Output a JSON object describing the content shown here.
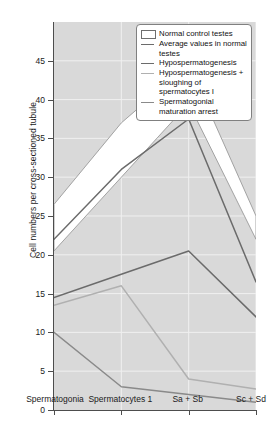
{
  "chart_data": {
    "type": "line",
    "title": "",
    "xlabel": "",
    "ylabel": "Cell numbers per cross-sectioned tubule",
    "categories": [
      "Spermatogonia",
      "Spermatocytes 1",
      "Sa + Sb",
      "Sc + Sd"
    ],
    "ylim": [
      0,
      50
    ],
    "yticks": [
      0,
      5,
      10,
      15,
      20,
      25,
      30,
      35,
      40,
      45
    ],
    "grid": true,
    "legend_position": "top-right",
    "band": {
      "name": "Normal control testes",
      "upper": [
        26.5,
        37.0,
        44.5,
        25.0
      ],
      "lower": [
        20.5,
        30.0,
        39.5,
        22.0
      ],
      "color": "#ffffff",
      "edge": "#9a9a9a"
    },
    "series": [
      {
        "name": "Average values in normal testes",
        "values": [
          22.0,
          31.0,
          37.5,
          16.5
        ],
        "color": "#6b6b6b"
      },
      {
        "name": "Hypospermatogenesis",
        "values": [
          14.5,
          17.5,
          20.5,
          12.0
        ],
        "color": "#6b6b6b"
      },
      {
        "name": "Hypospermatogenesis + sloughing of spermatocytes I",
        "values": [
          13.5,
          16.0,
          4.0,
          2.7
        ],
        "color": "#b0b0b0"
      },
      {
        "name": "Spermatogonial maturation arrest",
        "values": [
          10.0,
          3.0,
          2.0,
          1.0
        ],
        "color": "#8a8a8a"
      }
    ]
  },
  "axis": {
    "ylabel": "Cell numbers per cross-sectioned tubule",
    "ytick_labels": [
      "0",
      "5",
      "10",
      "15",
      "20",
      "25",
      "30",
      "35",
      "40",
      "45"
    ],
    "xtick_labels": [
      "Spermatogonia",
      "Spermatocytes 1",
      "Sa + Sb",
      "Sc + Sd"
    ]
  },
  "legend": {
    "items": [
      {
        "label": "Normal control testes",
        "key": "swatch",
        "color": "#ffffff"
      },
      {
        "label": "Average values in normal testes",
        "key": "line",
        "color": "#6b6b6b"
      },
      {
        "label": "Hypospermatogenesis",
        "key": "line",
        "color": "#6b6b6b"
      },
      {
        "label": "Hypospermatogenesis + sloughing of spermatocytes I",
        "key": "line",
        "color": "#b0b0b0"
      },
      {
        "label": "Spermatogonial maturation arrest",
        "key": "line",
        "color": "#8a8a8a"
      }
    ]
  },
  "colors": {
    "plot_background": "#d9d9d9",
    "grid": "#f0f0f0",
    "axis": "#4d4d4d",
    "band_fill": "#ffffff",
    "text": "#111111"
  }
}
